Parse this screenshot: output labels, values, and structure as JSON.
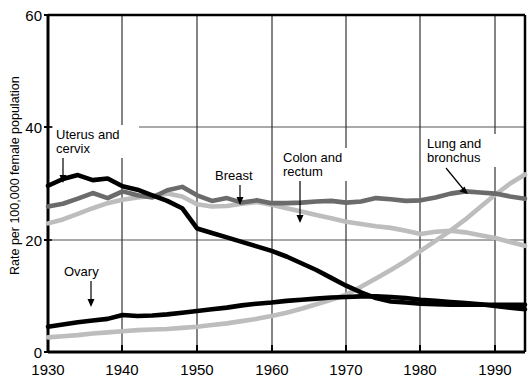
{
  "chart_data": {
    "type": "line",
    "title": "",
    "xlabel": "",
    "ylabel": "Rate per 100,000 female population",
    "xlim": [
      1930,
      1994
    ],
    "ylim": [
      0,
      60
    ],
    "xticks": [
      1930,
      1940,
      1950,
      1960,
      1970,
      1980,
      1990
    ],
    "yticks": [
      0,
      20,
      40,
      60
    ],
    "grid": true,
    "legend_position": "inline-annotations",
    "x": [
      1930,
      1932,
      1934,
      1936,
      1938,
      1940,
      1942,
      1944,
      1946,
      1948,
      1950,
      1952,
      1954,
      1956,
      1958,
      1960,
      1962,
      1964,
      1966,
      1968,
      1970,
      1972,
      1974,
      1976,
      1978,
      1980,
      1982,
      1984,
      1986,
      1988,
      1990,
      1992,
      1994
    ],
    "series": [
      {
        "name": "Uterus and cervix",
        "color": "#000000",
        "values": [
          29.6,
          30.8,
          31.5,
          30.6,
          30.9,
          29.5,
          28.9,
          27.9,
          26.9,
          25.6,
          22.0,
          21.2,
          20.4,
          19.6,
          18.8,
          18.0,
          17.0,
          15.8,
          14.6,
          13.2,
          11.8,
          10.6,
          9.6,
          9.0,
          8.8,
          8.6,
          8.5,
          8.4,
          8.4,
          8.4,
          8.4,
          8.4,
          8.4
        ]
      },
      {
        "name": "Breast",
        "color": "#6b6b6b",
        "values": [
          25.9,
          26.4,
          27.3,
          28.3,
          27.4,
          28.6,
          27.9,
          27.5,
          28.8,
          29.4,
          27.9,
          26.9,
          27.4,
          26.6,
          27.0,
          26.5,
          26.5,
          26.6,
          26.8,
          26.9,
          26.6,
          26.8,
          27.4,
          27.2,
          26.9,
          27.0,
          27.5,
          28.2,
          28.6,
          28.4,
          28.2,
          27.7,
          27.3
        ]
      },
      {
        "name": "Colon and rectum",
        "color": "#bdbdbd",
        "values": [
          22.9,
          23.6,
          24.6,
          25.6,
          26.5,
          27.1,
          27.5,
          27.8,
          28.2,
          27.7,
          26.3,
          25.9,
          26.0,
          26.4,
          26.7,
          26.2,
          25.6,
          25.0,
          24.4,
          23.8,
          23.2,
          22.8,
          22.4,
          22.1,
          21.6,
          21.0,
          21.4,
          21.6,
          21.3,
          20.8,
          20.3,
          19.6,
          18.9
        ]
      },
      {
        "name": "Ovary",
        "color": "#000000",
        "values": [
          4.5,
          4.9,
          5.3,
          5.6,
          5.9,
          6.6,
          6.4,
          6.5,
          6.7,
          7.0,
          7.3,
          7.6,
          7.9,
          8.3,
          8.6,
          8.8,
          9.1,
          9.3,
          9.5,
          9.7,
          9.8,
          9.9,
          9.9,
          9.8,
          9.6,
          9.3,
          9.1,
          8.9,
          8.7,
          8.5,
          8.2,
          7.9,
          7.6
        ]
      },
      {
        "name": "Lung and bronchus",
        "color": "#bdbdbd",
        "values": [
          2.6,
          2.8,
          3.0,
          3.3,
          3.5,
          3.7,
          3.9,
          4.0,
          4.1,
          4.3,
          4.5,
          4.8,
          5.1,
          5.5,
          5.9,
          6.4,
          7.0,
          7.7,
          8.5,
          9.3,
          10.2,
          11.6,
          13.1,
          14.6,
          16.2,
          18.0,
          19.8,
          21.6,
          23.6,
          25.8,
          28.0,
          30.0,
          31.6
        ]
      }
    ],
    "annotations": [
      {
        "label_line1": "Uterus and",
        "label_line2": "cervix",
        "series": "Uterus and cervix"
      },
      {
        "label_line1": "Ovary",
        "label_line2": "",
        "series": "Ovary"
      },
      {
        "label_line1": "Breast",
        "label_line2": "",
        "series": "Breast"
      },
      {
        "label_line1": "Colon and",
        "label_line2": "rectum",
        "series": "Colon and rectum"
      },
      {
        "label_line1": "Lung and",
        "label_line2": "bronchus",
        "series": "Lung and bronchus"
      }
    ]
  },
  "axes": {
    "ylabel": "Rate per 100,000 female population",
    "yticks": [
      "0",
      "20",
      "40",
      "60"
    ],
    "xticks": [
      "1930",
      "1940",
      "1950",
      "1960",
      "1970",
      "1980",
      "1990"
    ]
  },
  "annotations": {
    "uterus_l1": "Uterus and",
    "uterus_l2": "cervix",
    "ovary": "Ovary",
    "breast": "Breast",
    "colon_l1": "Colon and",
    "colon_l2": "rectum",
    "lung_l1": "Lung and",
    "lung_l2": "bronchus"
  },
  "colors": {
    "black": "#000000",
    "dark_gray": "#6b6b6b",
    "light_gray": "#bdbdbd",
    "grid": "#555555",
    "frame": "#000000"
  }
}
